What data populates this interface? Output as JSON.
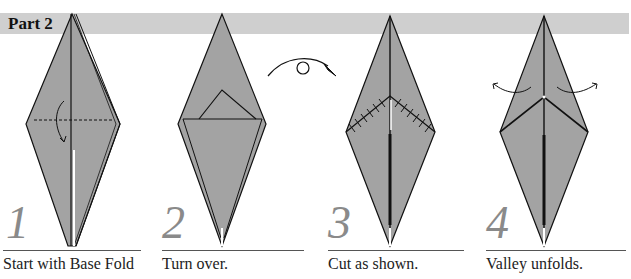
{
  "header": {
    "title": "Part 2"
  },
  "colors": {
    "paper": "#a3a3a3",
    "banner": "#cfcfcf",
    "step_number": "#8a8a8a",
    "line": "#111111"
  },
  "steps": [
    {
      "number": "1",
      "caption": "Start with Base Fold",
      "icon": "valley-fold-arrow-icon"
    },
    {
      "number": "2",
      "caption": "Turn over.",
      "icon": "turn-over-icon"
    },
    {
      "number": "3",
      "caption": "Cut as shown.",
      "icon": "cut-line-icon"
    },
    {
      "number": "4",
      "caption": "Valley unfolds.",
      "icon": "unfold-arrows-icon"
    }
  ]
}
